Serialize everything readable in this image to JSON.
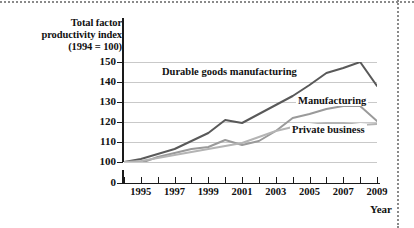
{
  "chart_data": {
    "type": "line",
    "title": "",
    "ylabel": "Total factor productivity index (1994 = 100)",
    "xlabel": "Year",
    "grid": true,
    "legend_position": "inline-annotations",
    "ylim": [
      100,
      150
    ],
    "y_axis_break": true,
    "yticks": [
      "150",
      "140",
      "130",
      "120",
      "110",
      "100",
      "0"
    ],
    "xlim": [
      1994,
      2009
    ],
    "x": [
      1994,
      1995,
      1996,
      1997,
      1998,
      1999,
      2000,
      2001,
      2002,
      2003,
      2004,
      2005,
      2006,
      2007,
      2008,
      2009
    ],
    "xticks": [
      1994,
      1995,
      1996,
      1997,
      1998,
      1999,
      2000,
      2001,
      2002,
      2003,
      2004,
      2005,
      2006,
      2007,
      2008,
      2009
    ],
    "xticklabels": [
      "",
      "1995",
      "",
      "1997",
      "",
      "1999",
      "",
      "2001",
      "",
      "2003",
      "",
      "2005",
      "",
      "2007",
      "",
      "2009"
    ],
    "series": [
      {
        "name": "Durable goods manufacturing",
        "color": "#595959",
        "values": [
          100,
          101.5,
          104,
          106.5,
          110.5,
          114.5,
          121,
          119.5,
          124,
          128.5,
          133,
          138.5,
          144.5,
          147,
          150,
          138
        ]
      },
      {
        "name": "Manufacturing",
        "color": "#9a9a9a",
        "values": [
          100,
          99.5,
          102.5,
          104.5,
          106.5,
          107.5,
          111,
          108.5,
          110.5,
          115.5,
          122,
          124,
          126.5,
          128,
          128,
          120.5
        ]
      },
      {
        "name": "Private business",
        "color": "#b4b4b4",
        "values": [
          100,
          100.5,
          102,
          103.5,
          105,
          106.5,
          108,
          109.5,
          112.5,
          115.5,
          117.5,
          118.5,
          119.5,
          119.5,
          118.5,
          119
        ]
      }
    ],
    "annotations": [
      {
        "text": "Durable goods manufacturing",
        "series": "Durable goods manufacturing"
      },
      {
        "text": "Manufacturing",
        "series": "Manufacturing"
      },
      {
        "text": "Private business",
        "series": "Private business"
      }
    ]
  }
}
